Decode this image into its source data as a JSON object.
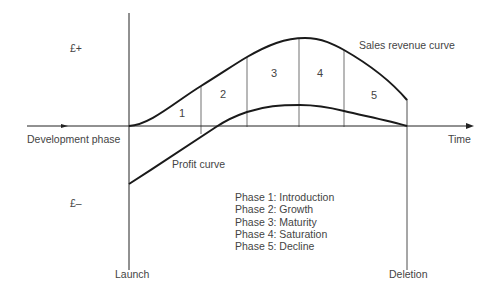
{
  "diagram": {
    "axis": {
      "y_positive": "£+",
      "y_negative": "£–",
      "x_label": "Time",
      "pre_launch_label": "Development phase",
      "launch_label": "Launch",
      "deletion_label": "Deletion"
    },
    "curves": {
      "sales": "Sales revenue curve",
      "profit": "Profit curve"
    },
    "phase_numbers": [
      "1",
      "2",
      "3",
      "4",
      "5"
    ],
    "legend": [
      "Phase 1: Introduction",
      "Phase 2: Growth",
      "Phase 3: Maturity",
      "Phase 4: Saturation",
      "Phase 5: Decline"
    ],
    "colors": {
      "line": "#1a1a1a",
      "text": "#444444",
      "background": "#ffffff"
    }
  }
}
